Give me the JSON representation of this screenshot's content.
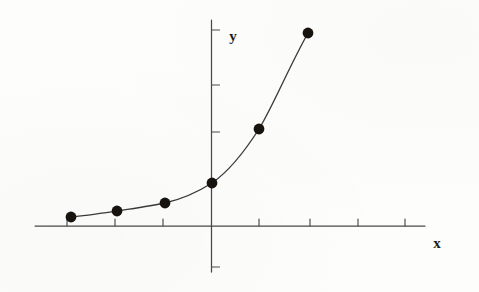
{
  "figure": {
    "background_color": "#fdfdfb",
    "ink_color": "#3a3a3c",
    "marker_color": "#17130f",
    "width": 479,
    "height": 292,
    "x_axis_label": "x",
    "y_axis_label": "y"
  },
  "chart_data": {
    "type": "line",
    "title": "",
    "subtitle": "",
    "xlabel": "x",
    "ylabel": "y",
    "grid": false,
    "legend": null,
    "x": [
      -3,
      -2,
      -1,
      0,
      1,
      2
    ],
    "values": [
      0.18,
      0.3,
      0.46,
      1.0,
      2.0,
      4.0
    ],
    "series": [
      {
        "name": "exponential curve",
        "x": [
          -3,
          -2,
          -1,
          0,
          1,
          2
        ],
        "values": [
          0.18,
          0.3,
          0.46,
          1.0,
          2.0,
          4.0
        ]
      }
    ],
    "xlim": [
      -3.65,
      4.45
    ],
    "ylim": [
      -0.95,
      4.3
    ],
    "x_tick_values": [
      -3,
      -2,
      -1,
      0,
      1,
      2,
      3,
      4
    ],
    "x_tick_labels": [
      "",
      "",
      "",
      "",
      "",
      "",
      "",
      ""
    ],
    "y_tick_values": [
      -1,
      1,
      2,
      4
    ],
    "y_tick_labels": [
      "",
      "",
      "",
      ""
    ],
    "points_px": [
      {
        "cx": 71,
        "cy": 217
      },
      {
        "cx": 117,
        "cy": 211
      },
      {
        "cx": 165,
        "cy": 203
      },
      {
        "cx": 212,
        "cy": 183
      },
      {
        "cx": 259,
        "cy": 129
      },
      {
        "cx": 308,
        "cy": 33
      }
    ],
    "marker": "filled-circle",
    "marker_radius_px": 5.4
  },
  "geometry": {
    "x_axis": {
      "y": 226,
      "x_start": 35,
      "x_end": 425
    },
    "y_axis": {
      "x": 211.5,
      "y_start": 20,
      "y_end": 272
    },
    "x_ticks_px": [
      67,
      115,
      163,
      259,
      310,
      358,
      405
    ],
    "x_tick_len": 7,
    "y_ticks_px": [
      30,
      85,
      132,
      267
    ],
    "y_tick_len": 8,
    "curve_path": "M 71,217 C 86,215.5 103,213 117,211 C 133,208.5 151,206 165,203 C 180,199.5 197,192.5 212,183 C 228,172 243,154 259,129 C 273,106 288,69 308,33",
    "label_x_pos": {
      "x": 437,
      "y": 248
    },
    "label_y_pos": {
      "x": 233,
      "y": 41
    }
  }
}
